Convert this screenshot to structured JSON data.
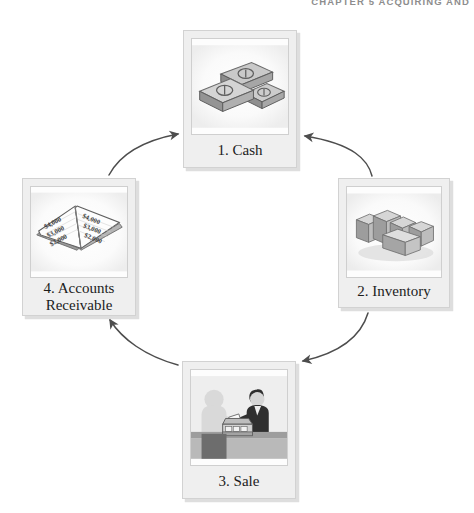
{
  "page": {
    "running_head": "CHAPTER 5   ACQUIRING AND",
    "background_color": "#ffffff",
    "ink_color": "#231f20"
  },
  "diagram": {
    "type": "cycle",
    "direction": "clockwise",
    "stage_count": 4,
    "stages": [
      {
        "id": "cash",
        "number": "1.",
        "label": "1. Cash",
        "label_line1": "1. Cash",
        "label_line2": "",
        "position": "top",
        "illustration": "money-stacks-icon",
        "illustration_description": "Three stacks of banknotes marked with dollar signs"
      },
      {
        "id": "inventory",
        "number": "2.",
        "label": "2. Inventory",
        "label_line1": "2. Inventory",
        "label_line2": "",
        "position": "right",
        "illustration": "stacked-boxes-icon",
        "illustration_description": "Rows of stacked cardboard cartons in a warehouse"
      },
      {
        "id": "sale",
        "number": "3.",
        "label": "3. Sale",
        "label_line1": "3. Sale",
        "label_line2": "",
        "position": "bottom",
        "illustration": "sale-counter-icon",
        "illustration_description": "Customer handing cash to a clerk at a counter with a cash register"
      },
      {
        "id": "accounts-receivable",
        "number": "4.",
        "label": "4. Accounts Receivable",
        "label_line1": "4. Accounts",
        "label_line2": "Receivable",
        "position": "left",
        "illustration": "ledger-book-icon",
        "illustration_description": "Open ledger book listing customer balances",
        "ledger_entries_left": [
          "$4,000",
          "$3,000",
          "$2,000"
        ],
        "ledger_entries_right": [
          "$4,000",
          "$3,000",
          "$2,000"
        ]
      }
    ],
    "arrows": [
      {
        "id": "arrow-cash-to-inventory",
        "from": "cash",
        "to": "inventory",
        "position": "top-right"
      },
      {
        "id": "arrow-inventory-to-sale",
        "from": "inventory",
        "to": "sale",
        "position": "bottom-right"
      },
      {
        "id": "arrow-sale-to-ar",
        "from": "sale",
        "to": "accounts-receivable",
        "position": "bottom-left"
      },
      {
        "id": "arrow-ar-to-cash",
        "from": "accounts-receivable",
        "to": "cash",
        "position": "top-left"
      }
    ]
  }
}
